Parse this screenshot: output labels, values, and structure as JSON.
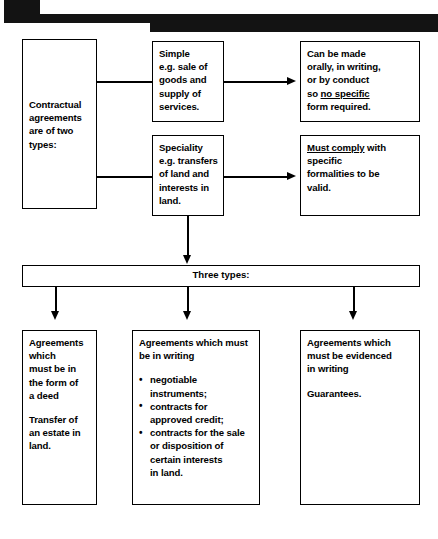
{
  "page": {
    "background_color": "#ffffff",
    "ink_color": "#000000"
  },
  "banner": {
    "name": "top-black-banner",
    "color": "#131313"
  },
  "diagram": {
    "root": {
      "label": "Contractual agreements are of two types:",
      "lines": [
        "Contractual",
        "agreements",
        "are of two",
        "types:"
      ]
    },
    "branches": [
      {
        "type_box": {
          "lines": [
            "Simple",
            "e.g. sale of",
            "goods and",
            "supply of",
            "services."
          ]
        },
        "result_box": {
          "lines_pre": [
            "Can be made",
            "orally, in writing,",
            "or by conduct",
            "so "
          ],
          "underlined": "no specific",
          "lines_post": [
            "form required."
          ]
        }
      },
      {
        "type_box": {
          "lines": [
            "Speciality",
            "e.g. transfers",
            "of land and",
            "interests in",
            "land."
          ]
        },
        "result_box": {
          "underlined": "Must comply",
          "lines_post": [
            " with",
            "specific",
            "formalities to be",
            "valid."
          ]
        }
      }
    ],
    "divider": {
      "label": "Three types:"
    },
    "outcomes": [
      {
        "heading_lines": [
          "Agreements",
          "which",
          "must be in",
          "the form of",
          "a deed"
        ],
        "body_lines": [
          "Transfer of",
          "an estate in",
          "land."
        ],
        "bullets": []
      },
      {
        "heading_lines": [
          "Agreements which must",
          "be in writing"
        ],
        "body_lines": [],
        "bullets": [
          [
            "negotiable",
            "instruments;"
          ],
          [
            "contracts for",
            "approved credit;"
          ],
          [
            "contracts for the sale",
            "or disposition of",
            "certain interests",
            "in land."
          ]
        ]
      },
      {
        "heading_lines": [
          "Agreements which",
          "must be evidenced",
          "in writing"
        ],
        "body_lines": [
          "Guarantees."
        ],
        "bullets": []
      }
    ]
  }
}
